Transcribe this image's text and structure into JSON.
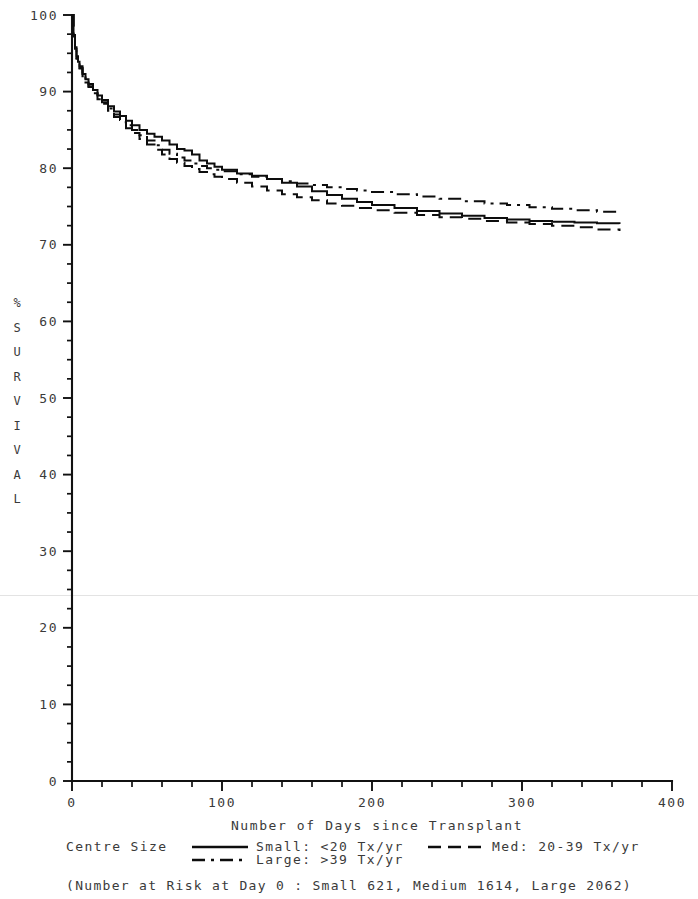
{
  "chart_data": {
    "type": "line",
    "title": "",
    "xlabel": "Number of Days since Transplant",
    "ylabel": "% SURVIVAL",
    "ylabel_chars": [
      "%",
      "S",
      "U",
      "R",
      "V",
      "I",
      "V",
      "A",
      "L"
    ],
    "xlim": [
      0,
      400
    ],
    "ylim": [
      0,
      100
    ],
    "xticks": [
      0,
      100,
      200,
      300,
      400
    ],
    "xtick_labels": [
      "0",
      "100",
      "200",
      "300",
      "400"
    ],
    "xminor_step": 20,
    "yticks": [
      0,
      10,
      20,
      30,
      40,
      50,
      60,
      70,
      80,
      90,
      100
    ],
    "ytick_labels": [
      "0",
      "10",
      "20",
      "30",
      "40",
      "50",
      "60",
      "70",
      "80",
      "90",
      "100"
    ],
    "yminor_step": 2.5,
    "grid": false,
    "legend_position": "below-axis",
    "legend_title": "Centre Size",
    "footnote": "(Number at Risk at Day 0 : Small 621, Medium 1614, Large 2062)",
    "series": [
      {
        "name": "Small: <20 Tx/yr",
        "short_name": "Small",
        "linestyle": "solid",
        "color": "#0d0d0d",
        "number_at_risk_day0": 621,
        "x": [
          0,
          1,
          2,
          3,
          4,
          5,
          7,
          9,
          11,
          14,
          17,
          20,
          24,
          28,
          32,
          36,
          40,
          45,
          50,
          55,
          60,
          65,
          70,
          75,
          80,
          85,
          90,
          95,
          100,
          110,
          120,
          130,
          140,
          150,
          160,
          170,
          180,
          190,
          200,
          215,
          230,
          245,
          260,
          275,
          290,
          305,
          320,
          335,
          350,
          365
        ],
        "y": [
          100.0,
          97.4,
          95.8,
          94.6,
          93.9,
          93.3,
          92.3,
          91.6,
          91.0,
          90.2,
          89.5,
          88.9,
          88.1,
          87.4,
          86.8,
          86.2,
          85.6,
          85.0,
          84.5,
          84.1,
          83.6,
          83.1,
          82.5,
          82.3,
          81.8,
          81.0,
          80.6,
          80.2,
          79.8,
          79.3,
          79.0,
          78.6,
          78.1,
          77.6,
          77.0,
          76.5,
          76.0,
          75.6,
          75.2,
          74.8,
          74.4,
          74.1,
          73.8,
          73.5,
          73.3,
          73.1,
          73.0,
          72.9,
          72.8,
          72.7
        ]
      },
      {
        "name": "Med: 20-39 Tx/yr",
        "short_name": "Medium",
        "linestyle": "dashed",
        "color": "#0d0d0d",
        "number_at_risk_day0": 1614,
        "x": [
          0,
          1,
          2,
          3,
          4,
          5,
          7,
          9,
          11,
          14,
          17,
          20,
          24,
          28,
          32,
          36,
          40,
          45,
          50,
          55,
          60,
          65,
          70,
          75,
          80,
          85,
          90,
          95,
          100,
          110,
          120,
          130,
          140,
          150,
          160,
          170,
          180,
          190,
          200,
          215,
          230,
          245,
          260,
          275,
          290,
          305,
          320,
          335,
          350,
          365
        ],
        "y": [
          100.0,
          97.2,
          95.5,
          94.3,
          93.6,
          93.0,
          92.0,
          91.2,
          90.6,
          89.8,
          89.0,
          88.4,
          87.5,
          86.7,
          86.0,
          85.2,
          84.6,
          83.8,
          83.1,
          82.4,
          81.8,
          81.2,
          80.7,
          80.3,
          79.9,
          79.5,
          79.2,
          78.9,
          78.6,
          78.1,
          77.6,
          77.1,
          76.6,
          76.2,
          75.8,
          75.4,
          75.1,
          74.8,
          74.5,
          74.2,
          73.9,
          73.6,
          73.4,
          73.1,
          72.9,
          72.7,
          72.5,
          72.3,
          72.0,
          71.8
        ]
      },
      {
        "name": "Large: >39 Tx/yr",
        "short_name": "Large",
        "linestyle": "dashdot",
        "color": "#0d0d0d",
        "number_at_risk_day0": 2062,
        "x": [
          0,
          1,
          2,
          3,
          4,
          5,
          7,
          9,
          11,
          14,
          17,
          20,
          24,
          28,
          32,
          36,
          40,
          45,
          50,
          55,
          60,
          65,
          70,
          75,
          80,
          85,
          90,
          95,
          100,
          110,
          120,
          130,
          140,
          150,
          160,
          170,
          180,
          190,
          200,
          215,
          230,
          245,
          260,
          275,
          290,
          305,
          320,
          335,
          350,
          365
        ],
        "y": [
          100.0,
          97.3,
          95.6,
          94.4,
          93.7,
          93.1,
          92.1,
          91.3,
          90.7,
          89.9,
          89.2,
          88.6,
          87.8,
          87.0,
          86.3,
          85.6,
          85.0,
          84.3,
          83.6,
          83.0,
          82.4,
          81.9,
          81.4,
          81.0,
          80.6,
          80.3,
          80.0,
          79.8,
          79.6,
          79.2,
          78.9,
          78.6,
          78.3,
          78.0,
          77.8,
          77.5,
          77.3,
          77.1,
          76.9,
          76.6,
          76.3,
          76.0,
          75.7,
          75.4,
          75.2,
          74.9,
          74.7,
          74.5,
          74.3,
          74.1
        ]
      }
    ]
  },
  "legend": {
    "title": "Centre Size",
    "entries": [
      {
        "label": "Small: <20 Tx/yr",
        "linestyle": "solid"
      },
      {
        "label": "Med: 20-39 Tx/yr",
        "linestyle": "dashed"
      },
      {
        "label": "Large: >39 Tx/yr",
        "linestyle": "dashdot"
      }
    ]
  },
  "footnote": {
    "text": "(Number at Risk at Day 0 : Small 621, Medium 1614, Large 2062)"
  },
  "axes": {
    "x_title": "Number of Days since Transplant",
    "y_title": "% SURVIVAL"
  }
}
